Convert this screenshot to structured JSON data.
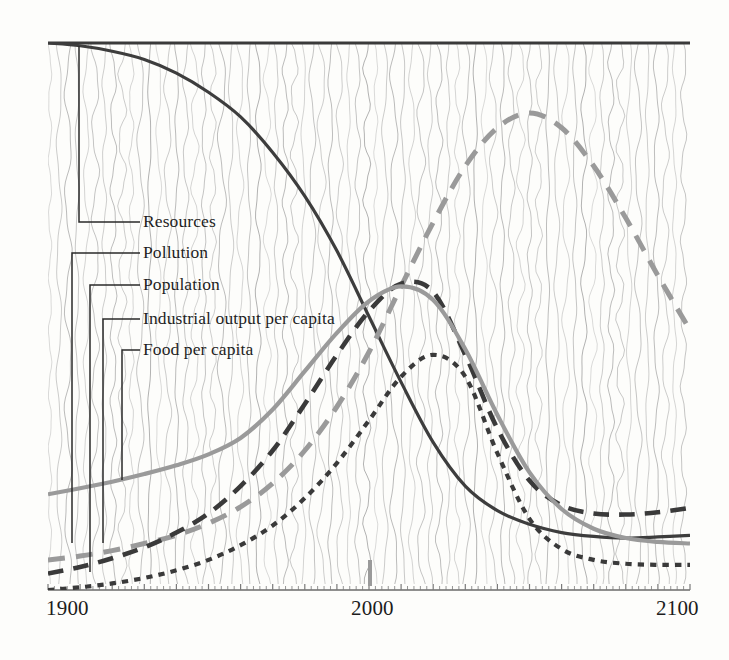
{
  "figure": {
    "name": "world-model-standard-run",
    "background_color": "#fdfdfb",
    "texture": "vertical-wavy-hatch",
    "texture_color": "#8c8c8c"
  },
  "axis": {
    "x_ticks": [
      {
        "label": "1900",
        "value": 1900
      },
      {
        "label": "2000",
        "value": 2000
      },
      {
        "label": "2100",
        "value": 2100
      }
    ],
    "x_min": 1900,
    "x_max": 2100,
    "y_axis_shown": false,
    "y_min": 0,
    "y_max": 1
  },
  "legend": {
    "position": "inside-left",
    "entries": [
      {
        "key": "resources",
        "label": "Resources"
      },
      {
        "key": "pollution",
        "label": "Pollution"
      },
      {
        "key": "population",
        "label": "Population"
      },
      {
        "key": "industrial",
        "label": "Industrial output per capita"
      },
      {
        "key": "food",
        "label": "Food per capita"
      }
    ]
  },
  "chart_data": {
    "type": "line",
    "title": "",
    "subtitle": "",
    "xlabel": "",
    "ylabel": "",
    "xlim": [
      1900,
      2100
    ],
    "ylim": [
      0,
      1
    ],
    "grid": false,
    "legend_position": "inside-left",
    "xtick_labels": [
      "1900",
      "2000",
      "2100"
    ],
    "x": [
      1900,
      1910,
      1920,
      1930,
      1940,
      1950,
      1960,
      1970,
      1980,
      1990,
      2000,
      2010,
      2020,
      2030,
      2040,
      2050,
      2060,
      2070,
      2080,
      2090,
      2100
    ],
    "series": [
      {
        "name": "Resources",
        "color": "#3d3d3d",
        "style": "solid",
        "width": 3.2,
        "values": [
          1.0,
          0.995,
          0.985,
          0.97,
          0.945,
          0.91,
          0.865,
          0.8,
          0.72,
          0.62,
          0.5,
          0.38,
          0.27,
          0.19,
          0.145,
          0.12,
          0.105,
          0.098,
          0.095,
          0.097,
          0.1
        ]
      },
      {
        "name": "Pollution",
        "color": "#9a9a9a",
        "style": "long-dash",
        "width": 5.0,
        "values": [
          0.055,
          0.062,
          0.072,
          0.085,
          0.1,
          0.122,
          0.152,
          0.195,
          0.255,
          0.335,
          0.435,
          0.555,
          0.672,
          0.775,
          0.845,
          0.872,
          0.845,
          0.775,
          0.68,
          0.575,
          0.475
        ]
      },
      {
        "name": "Population",
        "color": "#3a3a3a",
        "style": "long-dash",
        "width": 4.6,
        "values": [
          0.03,
          0.042,
          0.058,
          0.078,
          0.105,
          0.14,
          0.19,
          0.255,
          0.34,
          0.43,
          0.51,
          0.56,
          0.545,
          0.43,
          0.295,
          0.2,
          0.155,
          0.14,
          0.138,
          0.142,
          0.15
        ]
      },
      {
        "name": "Industrial output per capita",
        "color": "#3a3a3a",
        "style": "short-dash",
        "width": 4.2,
        "values": [
          0.0,
          0.005,
          0.012,
          0.022,
          0.036,
          0.055,
          0.082,
          0.118,
          0.168,
          0.232,
          0.31,
          0.39,
          0.43,
          0.39,
          0.25,
          0.13,
          0.075,
          0.055,
          0.048,
          0.046,
          0.046
        ]
      },
      {
        "name": "Food per capita",
        "color": "#9a9a9a",
        "style": "solid",
        "width": 4.2,
        "values": [
          0.175,
          0.186,
          0.198,
          0.212,
          0.228,
          0.248,
          0.278,
          0.33,
          0.4,
          0.47,
          0.528,
          0.555,
          0.53,
          0.44,
          0.32,
          0.215,
          0.148,
          0.112,
          0.095,
          0.088,
          0.085
        ]
      }
    ],
    "annotations": [
      {
        "name": "peak-pollution",
        "series": "Pollution",
        "x": 2052,
        "y": 0.874
      },
      {
        "name": "peak-population",
        "series": "Population",
        "x": 2014,
        "y": 0.562
      },
      {
        "name": "peak-industrial",
        "series": "Industrial output per capita",
        "x": 2037,
        "y": 0.437
      },
      {
        "name": "peak-food",
        "series": "Food per capita",
        "x": 2009,
        "y": 0.558
      }
    ]
  }
}
